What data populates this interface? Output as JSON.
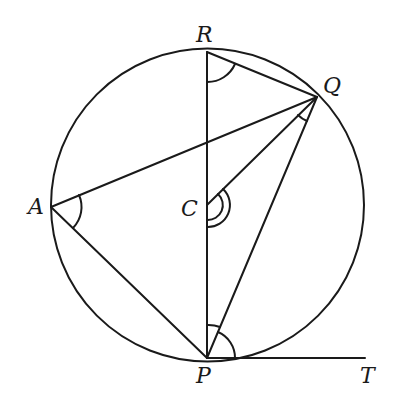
{
  "diagram": {
    "type": "circle-geometry",
    "stroke_color": "#1a1a1a",
    "circle": {
      "cx": 207.5,
      "cy": 205,
      "r": 156.5
    },
    "points": {
      "R": {
        "label": "R",
        "x": 207,
        "y": 52,
        "lx": 196,
        "ly": 42
      },
      "Q": {
        "label": "Q",
        "x": 317,
        "y": 97,
        "lx": 323,
        "ly": 93
      },
      "A": {
        "label": "A",
        "x": 51,
        "y": 207,
        "lx": 28,
        "ly": 214
      },
      "C": {
        "label": "C",
        "x": 207,
        "y": 205,
        "lx": 181,
        "ly": 216
      },
      "P": {
        "label": "P",
        "x": 207,
        "y": 358,
        "lx": 196,
        "ly": 383
      },
      "T": {
        "label": "T",
        "x": 365,
        "y": 358,
        "lx": 360,
        "ly": 383
      }
    },
    "segments": [
      {
        "from": "R",
        "to": "P"
      },
      {
        "from": "R",
        "to": "Q"
      },
      {
        "from": "A",
        "to": "Q"
      },
      {
        "from": "A",
        "to": "P"
      },
      {
        "from": "C",
        "to": "Q"
      },
      {
        "from": "P",
        "to": "Q"
      },
      {
        "from": "P",
        "to": "T"
      }
    ],
    "angle_marks": [
      {
        "at": "R",
        "between": [
          "P",
          "Q"
        ],
        "arcs": 1
      },
      {
        "at": "Q",
        "between": [
          "C",
          "P"
        ],
        "arcs": 1
      },
      {
        "at": "A",
        "between": [
          "Q",
          "P"
        ],
        "arcs": 1
      },
      {
        "at": "C",
        "between": [
          "Q",
          "P"
        ],
        "arcs": 2
      },
      {
        "at": "P",
        "between": [
          "R",
          "Q"
        ],
        "arcs": 1
      },
      {
        "at": "P",
        "between": [
          "Q",
          "T"
        ],
        "arcs": 1
      }
    ],
    "labels": {
      "R": "R",
      "Q": "Q",
      "A": "A",
      "C": "C",
      "P": "P",
      "T": "T"
    }
  }
}
